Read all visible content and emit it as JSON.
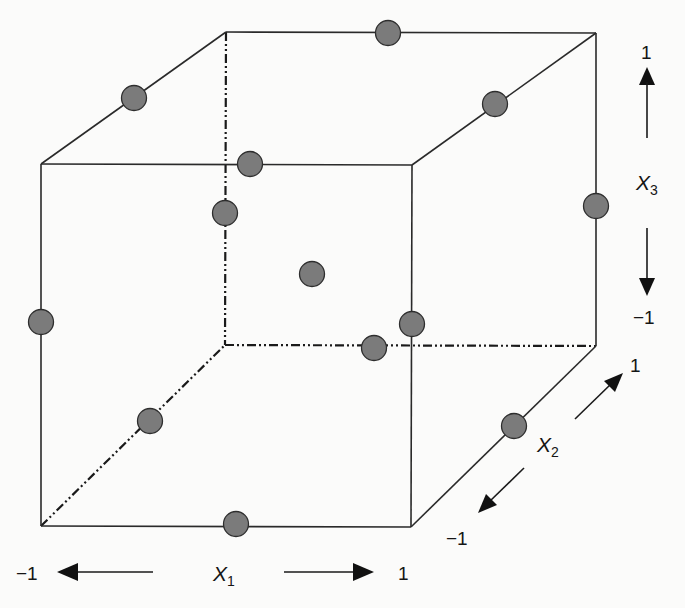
{
  "axes": {
    "x1": {
      "label_var": "X",
      "label_sub": "1",
      "low": "−1",
      "high": "1"
    },
    "x2": {
      "label_var": "X",
      "label_sub": "2",
      "low": "−1",
      "high": "1"
    },
    "x3": {
      "label_var": "X",
      "label_sub": "3",
      "low": "−1",
      "high": "1"
    }
  },
  "colors": {
    "edge": "#2a2a2a",
    "point_fill": "#7b7b7b",
    "point_stroke": "#2e2e2e",
    "background": "#fbfbfa"
  },
  "cube": {
    "vertices": {
      "front_top_left": [
        41,
        164
      ],
      "front_top_right": [
        412,
        165
      ],
      "front_bottom_left": [
        41,
        526
      ],
      "front_bottom_right": [
        411,
        527
      ],
      "back_top_left": [
        226,
        32
      ],
      "back_top_right": [
        596,
        33
      ],
      "back_bottom_left": [
        225,
        345
      ],
      "back_bottom_right": [
        596,
        346
      ]
    },
    "hidden_edges": [
      "back_top_left-back_bottom_left",
      "back_bottom_left-back_bottom_right",
      "front_bottom_left-back_bottom_left"
    ]
  },
  "design_points": [
    {
      "id": "top-back-edge",
      "coded": [
        0,
        1,
        1
      ],
      "pos": [
        388,
        33
      ]
    },
    {
      "id": "top-left-edge",
      "coded": [
        -1,
        0,
        1
      ],
      "pos": [
        134,
        98
      ]
    },
    {
      "id": "top-right-edge",
      "coded": [
        1,
        0,
        1
      ],
      "pos": [
        495,
        104
      ]
    },
    {
      "id": "top-front-edge",
      "coded": [
        0,
        -1,
        1
      ],
      "pos": [
        250,
        164
      ]
    },
    {
      "id": "back-left-vertical-edge",
      "coded": [
        -1,
        1,
        0
      ],
      "pos": [
        225,
        213
      ]
    },
    {
      "id": "back-right-vertical-edge",
      "coded": [
        1,
        1,
        0
      ],
      "pos": [
        596,
        206
      ]
    },
    {
      "id": "center-point",
      "coded": [
        0,
        0,
        0
      ],
      "pos": [
        312,
        274
      ]
    },
    {
      "id": "front-left-vertical-edge",
      "coded": [
        -1,
        -1,
        0
      ],
      "pos": [
        41,
        322
      ]
    },
    {
      "id": "front-right-vertical-edge",
      "coded": [
        1,
        -1,
        0
      ],
      "pos": [
        412,
        324
      ]
    },
    {
      "id": "bottom-back-edge",
      "coded": [
        0,
        1,
        -1
      ],
      "pos": [
        374,
        348
      ]
    },
    {
      "id": "bottom-left-edge",
      "coded": [
        -1,
        0,
        -1
      ],
      "pos": [
        150,
        421
      ]
    },
    {
      "id": "bottom-right-edge",
      "coded": [
        1,
        0,
        -1
      ],
      "pos": [
        514,
        426
      ]
    },
    {
      "id": "bottom-front-edge",
      "coded": [
        0,
        -1,
        -1
      ],
      "pos": [
        236,
        524
      ]
    }
  ]
}
